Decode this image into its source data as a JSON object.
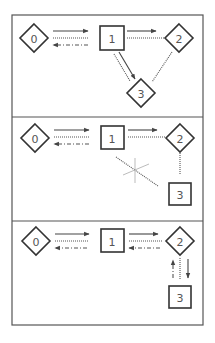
{
  "diagram": {
    "panels": [
      {
        "id": "panel-1",
        "nodes": [
          {
            "label": "0",
            "shape": "diamond"
          },
          {
            "label": "1",
            "shape": "square"
          },
          {
            "label": "2",
            "shape": "diamond"
          },
          {
            "label": "3",
            "shape": "diamond"
          }
        ],
        "edges": [
          {
            "from": "0",
            "to": "1",
            "style": "solid",
            "arrow": true
          },
          {
            "from": "0",
            "to": "1",
            "style": "dotted",
            "arrow": false
          },
          {
            "from": "1",
            "to": "0",
            "style": "dash-dot",
            "arrow": true
          },
          {
            "from": "1",
            "to": "2",
            "style": "solid",
            "arrow": true
          },
          {
            "from": "1",
            "to": "2",
            "style": "dotted",
            "arrow": false
          },
          {
            "from": "1",
            "to": "3",
            "style": "solid",
            "arrow": true
          },
          {
            "from": "1",
            "to": "3",
            "style": "dotted",
            "arrow": false
          },
          {
            "from": "2",
            "to": "3",
            "style": "dotted",
            "arrow": false
          }
        ]
      },
      {
        "id": "panel-2",
        "nodes": [
          {
            "label": "0",
            "shape": "diamond"
          },
          {
            "label": "1",
            "shape": "square"
          },
          {
            "label": "2",
            "shape": "diamond"
          },
          {
            "label": "3",
            "shape": "square"
          }
        ],
        "edges": [
          {
            "from": "0",
            "to": "1",
            "style": "solid",
            "arrow": true
          },
          {
            "from": "0",
            "to": "1",
            "style": "dotted",
            "arrow": false
          },
          {
            "from": "1",
            "to": "0",
            "style": "dash-dot",
            "arrow": true
          },
          {
            "from": "1",
            "to": "2",
            "style": "solid",
            "arrow": true
          },
          {
            "from": "1",
            "to": "2",
            "style": "dotted",
            "arrow": false
          },
          {
            "from": "2",
            "to": "3",
            "style": "dotted",
            "arrow": false
          },
          {
            "from": "1",
            "to": "3",
            "style": "dotted",
            "arrow": false,
            "crossed_out": true
          }
        ]
      },
      {
        "id": "panel-3",
        "nodes": [
          {
            "label": "0",
            "shape": "diamond"
          },
          {
            "label": "1",
            "shape": "square"
          },
          {
            "label": "2",
            "shape": "diamond"
          },
          {
            "label": "3",
            "shape": "square"
          }
        ],
        "edges": [
          {
            "from": "0",
            "to": "1",
            "style": "solid",
            "arrow": true
          },
          {
            "from": "0",
            "to": "1",
            "style": "dotted",
            "arrow": false
          },
          {
            "from": "1",
            "to": "0",
            "style": "dash-dot",
            "arrow": true
          },
          {
            "from": "1",
            "to": "2",
            "style": "solid",
            "arrow": true
          },
          {
            "from": "1",
            "to": "2",
            "style": "dotted",
            "arrow": false
          },
          {
            "from": "2",
            "to": "1",
            "style": "dash-dot",
            "arrow": true
          },
          {
            "from": "3",
            "to": "2",
            "style": "dash-dot",
            "arrow": true
          },
          {
            "from": "2",
            "to": "3",
            "style": "dotted",
            "arrow": false
          },
          {
            "from": "2",
            "to": "3",
            "style": "solid",
            "arrow": true
          }
        ]
      }
    ]
  }
}
